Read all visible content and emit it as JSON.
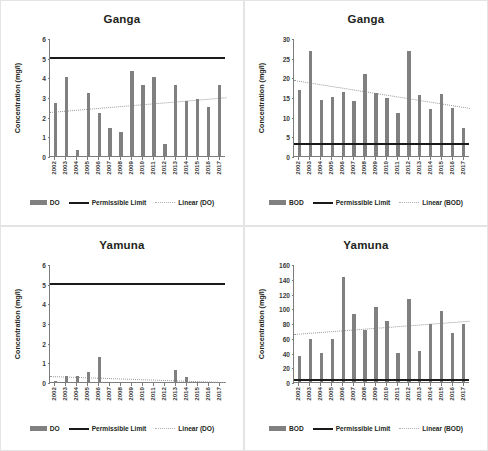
{
  "figure": {
    "background": "#ffffff",
    "bar_color": "#808080",
    "limit_color": "#1a1a1a",
    "trend_color": "#9a9a9a",
    "axis_color": "#7c7c7c"
  },
  "panels": [
    {
      "key": "ganga_do",
      "title": "Ganga",
      "ylabel": "Concentration (mg/l)",
      "legend": [
        {
          "type": "bar",
          "label": "DO"
        },
        {
          "type": "line",
          "label": "Permissible Limit"
        },
        {
          "type": "dot",
          "label": "Linear (DO)"
        }
      ]
    },
    {
      "key": "ganga_bod",
      "title": "Ganga",
      "ylabel": "Concentration (mg/l)",
      "legend": [
        {
          "type": "bar",
          "label": "BOD"
        },
        {
          "type": "line",
          "label": "Permissible Limit"
        },
        {
          "type": "dot",
          "label": "Linear (BOD)"
        }
      ]
    },
    {
      "key": "yamuna_do",
      "title": "Yamuna",
      "ylabel": "Concentration (mg/l)",
      "legend": [
        {
          "type": "bar",
          "label": "DO"
        },
        {
          "type": "line",
          "label": "Permissible Limit"
        },
        {
          "type": "dot",
          "label": "Linear (DO)"
        }
      ]
    },
    {
      "key": "yamuna_bod",
      "title": "Yamuna",
      "ylabel": "Concentration (mg/l)",
      "legend": [
        {
          "type": "bar",
          "label": "BOD"
        },
        {
          "type": "line",
          "label": "Permissible Limit"
        },
        {
          "type": "dot",
          "label": "Linear (BOD)"
        }
      ]
    }
  ],
  "chart_data": [
    {
      "key": "ganga_do",
      "type": "bar",
      "title": "Ganga",
      "xlabel": "",
      "ylabel": "Concentration (mg/l)",
      "ylim": [
        0,
        6
      ],
      "yticks": [
        0,
        1,
        2,
        3,
        4,
        5,
        6
      ],
      "grid": false,
      "legend_position": "bottom",
      "categories": [
        "2002",
        "2003",
        "2004",
        "2005",
        "2006",
        "2007",
        "2008",
        "2009",
        "2010",
        "2011",
        "2012",
        "2013",
        "2014",
        "2015",
        "2016",
        "2017"
      ],
      "series": [
        {
          "name": "DO",
          "type": "bar",
          "values": [
            2.7,
            4.0,
            0.3,
            3.2,
            2.2,
            1.4,
            1.2,
            4.3,
            3.6,
            4.0,
            0.6,
            3.6,
            2.8,
            2.9,
            2.5,
            3.6
          ]
        }
      ],
      "permissible_limit": {
        "name": "Permissible Limit",
        "value": 5.0
      },
      "trendline": {
        "name": "Linear (DO)",
        "start": 2.3,
        "end": 3.05
      }
    },
    {
      "key": "ganga_bod",
      "type": "bar",
      "title": "Ganga",
      "xlabel": "",
      "ylabel": "Concentration (mg/l)",
      "ylim": [
        0,
        30
      ],
      "yticks": [
        0,
        5,
        10,
        15,
        20,
        25,
        30
      ],
      "grid": false,
      "legend_position": "bottom",
      "categories": [
        "2002",
        "2003",
        "2004",
        "2005",
        "2006",
        "2007",
        "2008",
        "2009",
        "2010",
        "2011",
        "2012",
        "2013",
        "2014",
        "2015",
        "2016",
        "2017"
      ],
      "series": [
        {
          "name": "BOD",
          "type": "bar",
          "values": [
            16.8,
            26.8,
            14.3,
            15.1,
            16.3,
            13.9,
            20.8,
            16.0,
            14.8,
            10.9,
            26.7,
            15.4,
            11.9,
            15.8,
            12.1,
            7.1
          ]
        }
      ],
      "permissible_limit": {
        "name": "Permissible Limit",
        "value": 3.0
      },
      "trendline": {
        "name": "Linear (BOD)",
        "start": 19.5,
        "end": 12.4
      }
    },
    {
      "key": "yamuna_do",
      "type": "bar",
      "title": "Yamuna",
      "xlabel": "",
      "ylabel": "Concentration (mg/l)",
      "ylim": [
        0,
        6
      ],
      "yticks": [
        0,
        1,
        2,
        3,
        4,
        5,
        6
      ],
      "grid": false,
      "legend_position": "bottom",
      "categories": [
        "2002",
        "2003",
        "2004",
        "2005",
        "2006",
        "2007",
        "2008",
        "2009",
        "2010",
        "2011",
        "2012",
        "2013",
        "2014",
        "2015",
        "2016",
        "2017"
      ],
      "series": [
        {
          "name": "DO",
          "type": "bar",
          "values": [
            0.07,
            0.3,
            0.3,
            0.5,
            1.28,
            0.0,
            0.0,
            0.0,
            0.0,
            0.0,
            0.0,
            0.6,
            0.28,
            0.0,
            0.0,
            0.0
          ]
        }
      ],
      "permissible_limit": {
        "name": "Permissible Limit",
        "value": 5.0
      },
      "trendline": {
        "name": "Linear (DO)",
        "start": 0.37,
        "end": 0.06
      }
    },
    {
      "key": "yamuna_bod",
      "type": "bar",
      "title": "Yamuna",
      "xlabel": "",
      "ylabel": "Concentration (mg/l)",
      "ylim": [
        0,
        160
      ],
      "yticks": [
        0,
        20,
        40,
        60,
        80,
        100,
        120,
        140,
        160
      ],
      "grid": false,
      "legend_position": "bottom",
      "categories": [
        "2002",
        "2003",
        "2004",
        "2005",
        "2006",
        "2007",
        "2008",
        "2009",
        "2010",
        "2011",
        "2012",
        "2013",
        "2014",
        "2015",
        "2016",
        "2017"
      ],
      "series": [
        {
          "name": "BOD",
          "type": "bar",
          "values": [
            35,
            58,
            40,
            59,
            143,
            92,
            70,
            102,
            83,
            40,
            112,
            42,
            78,
            96,
            66,
            79
          ]
        }
      ],
      "permissible_limit": {
        "name": "Permissible Limit",
        "value": 3.0
      },
      "trendline": {
        "name": "Linear (BOD)",
        "start": 67,
        "end": 85
      }
    }
  ]
}
